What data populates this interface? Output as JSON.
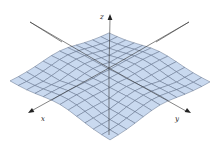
{
  "figure": {
    "type": "3d-surface-wireframe",
    "axes": {
      "z": {
        "label": "z"
      },
      "x": {
        "label": "x"
      },
      "y": {
        "label": "y"
      }
    },
    "colors": {
      "surface_fill": "#c9d9ef",
      "mesh_line": "#55657f",
      "edge_line": "#6a7a96",
      "axis_line": "#333333"
    },
    "mesh": {
      "grid_divisions": 12,
      "extent": 1.0
    }
  }
}
